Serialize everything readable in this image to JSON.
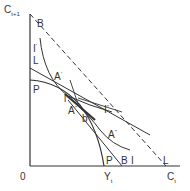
{
  "diagram": {
    "axes": {
      "y_label": "C",
      "y_sub": "t+1",
      "x_label": "C",
      "x_sub": "t",
      "origin": "0",
      "yt_label": "Y",
      "yt_sub": "t"
    },
    "labels": {
      "B_top": "B",
      "I_prime": "I",
      "I_prime_mark": "'",
      "L_left": "L",
      "P_left": "P",
      "A_prime": "A",
      "A_prime_mark": "'",
      "l_small": "l",
      "A_dblprime": "A",
      "A_dblprime_mark": "\"",
      "b_small": "b",
      "I_dbl": "I",
      "I_dbl_mark": "\"",
      "A_triple": "A",
      "A_triple_mark": "\"",
      "I_right": "I",
      "P_bottom": "P",
      "B_bottom": "B",
      "L_bottom": "L"
    },
    "colors": {
      "line": "#333333",
      "background": "#ffffff"
    }
  }
}
